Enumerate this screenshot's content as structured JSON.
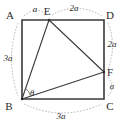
{
  "figure": {
    "kind": "geometry-diagram",
    "background_color": "#ffffff",
    "line_color": "#3a3a3a",
    "leader_color": "#9a9a9a",
    "text_color": "#2b2b2b"
  },
  "vertices": {
    "a": {
      "label": "A",
      "x": 22,
      "y": 20,
      "label_x": 10,
      "label_y": 19
    },
    "b": {
      "label": "B",
      "x": 22,
      "y": 99,
      "label_x": 9,
      "label_y": 110
    },
    "c": {
      "label": "C",
      "x": 104,
      "y": 99,
      "label_x": 107,
      "label_y": 110
    },
    "d": {
      "label": "D",
      "x": 104,
      "y": 20,
      "label_x": 107,
      "label_y": 19
    },
    "e": {
      "label": "E",
      "x": 49,
      "y": 20,
      "label_x": 45,
      "label_y": 15
    },
    "f": {
      "label": "F",
      "x": 104,
      "y": 72,
      "label_x": 107,
      "label_y": 75
    }
  },
  "dimensions": [
    {
      "name": "ae",
      "label": "a",
      "text_x": 35,
      "text_y": 12,
      "side": "top-left"
    },
    {
      "name": "ed",
      "label": "2a",
      "text_x": 73,
      "text_y": 11,
      "side": "top-right"
    },
    {
      "name": "df",
      "label": "2a",
      "text_x": 112,
      "text_y": 47,
      "side": "right-upper"
    },
    {
      "name": "fc",
      "label": "a",
      "text_x": 112,
      "text_y": 89,
      "side": "right-lower"
    },
    {
      "name": "bc",
      "label": "3a",
      "text_x": 61,
      "text_y": 119,
      "side": "bottom"
    },
    {
      "name": "ab",
      "label": "3a",
      "text_x": 8,
      "text_y": 61,
      "side": "left"
    }
  ],
  "angle": {
    "name": "theta-at-b",
    "label": "θ",
    "text_x": 32,
    "text_y": 96,
    "vertex": "B"
  }
}
